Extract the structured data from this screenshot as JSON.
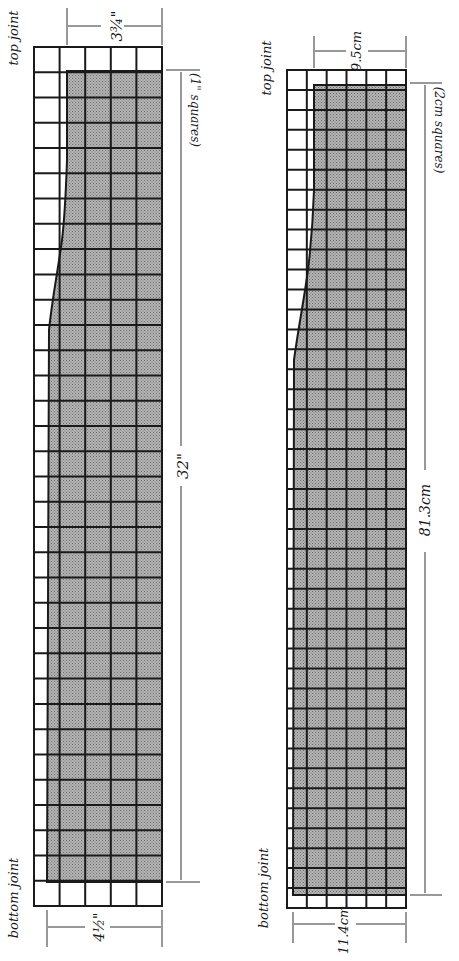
{
  "diagrams": [
    {
      "id": "imperial",
      "top_label": "top joint",
      "bottom_label": "bottom joint",
      "top_width": "3¾\"",
      "bottom_width": "4½\"",
      "length": "32\"",
      "grid_note": "(1\" squares)",
      "columns": 5,
      "rows": 34
    },
    {
      "id": "metric",
      "top_label": "top joint",
      "bottom_label": "bottom joint",
      "top_width": "9.5cm",
      "bottom_width": "11.4cm",
      "length": "81.3cm",
      "grid_note": "(2cm squares)",
      "columns": 6,
      "rows": 42
    }
  ],
  "colors": {
    "grid_line": "#1a1a1a",
    "shade": "#a9a9a9",
    "background": "#ffffff"
  }
}
